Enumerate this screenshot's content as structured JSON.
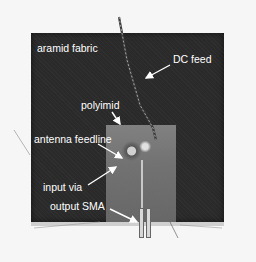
{
  "image": {
    "description": "Photograph of a textile antenna prototype: dark aramid fabric square with a polyimid substrate patch, DC feed wire, and output SMA connector, with white annotation labels and arrows",
    "colors": {
      "background": "#f6f6f6",
      "fabric": "#2a2a2a",
      "polyimid": "#7a7a7a",
      "label_text": "#ffffff"
    }
  },
  "labels": {
    "fabric": "aramid fabric",
    "dc_feed": "DC feed",
    "polyimid": "polyimid",
    "antenna_feedline": "antenna feedline",
    "input_via": "input via",
    "output_sma": "output SMA"
  }
}
